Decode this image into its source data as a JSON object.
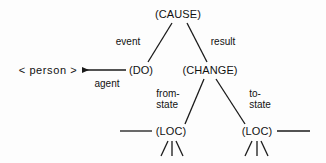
{
  "diagram": {
    "type": "conceptual-dependency-tree",
    "background_color": "#fdfdfd",
    "stroke_color": "#1a1a1a",
    "text_color": "#111111",
    "nodes": [
      {
        "id": "cause",
        "label": "(CAUSE)",
        "x": 178,
        "y": 14
      },
      {
        "id": "do",
        "label": "(DO)",
        "x": 141,
        "y": 70
      },
      {
        "id": "change",
        "label": "(CHANGE)",
        "x": 210,
        "y": 70
      },
      {
        "id": "person",
        "label": "< person >",
        "x": 48,
        "y": 70
      },
      {
        "id": "loc-from",
        "label": "(LOC)",
        "x": 171,
        "y": 131
      },
      {
        "id": "loc-to",
        "label": "(LOC)",
        "x": 257,
        "y": 131
      }
    ],
    "edges": [
      {
        "id": "cause-event",
        "from": "cause",
        "to": "do",
        "label": "event",
        "label_x": 128,
        "label_y": 41
      },
      {
        "id": "cause-result",
        "from": "cause",
        "to": "change",
        "label": "result",
        "label_x": 223,
        "label_y": 41
      },
      {
        "id": "do-agent",
        "from": "do",
        "to": "person",
        "label": "agent",
        "label_x": 107,
        "label_y": 83,
        "arrow": true
      },
      {
        "id": "change-from-state",
        "from": "change",
        "to": "loc-from",
        "label": "from-\nstate",
        "label_x": 168,
        "label_y": 99
      },
      {
        "id": "change-to-state",
        "from": "change",
        "to": "loc-to",
        "label": "to-\nstate",
        "label_x": 260,
        "label_y": 99
      }
    ],
    "edge_labels": {
      "event": "event",
      "result": "result",
      "agent": "agent",
      "from_state_line1": "from-",
      "from_state_line2": "state",
      "to_state_line1": "to-",
      "to_state_line2": "state"
    },
    "node_labels": {
      "cause": "(CAUSE)",
      "do": "(DO)",
      "change": "(CHANGE)",
      "person": "< person >",
      "loc_from": "(LOC)",
      "loc_to": "(LOC)"
    }
  }
}
